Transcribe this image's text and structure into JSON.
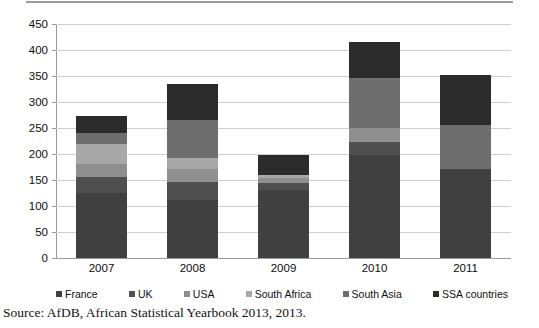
{
  "figure": {
    "source_note": "Source: AfDB, African Statistical Yearbook 2013, 2013."
  },
  "chart_data": {
    "type": "bar",
    "stacked": true,
    "title": "",
    "xlabel": "",
    "ylabel": "",
    "categories": [
      "2007",
      "2008",
      "2009",
      "2010",
      "2011"
    ],
    "ylim": [
      0,
      450
    ],
    "yticks": [
      0,
      50,
      100,
      150,
      200,
      250,
      300,
      350,
      400,
      450
    ],
    "ytick_labels": [
      "0",
      "50",
      "100",
      "150",
      "200",
      "250",
      "300",
      "350",
      "400",
      "450"
    ],
    "grid": true,
    "legend_position": "bottom",
    "series": [
      {
        "name": "France",
        "color": "#404040",
        "values": [
          125,
          112,
          130,
          198,
          172
        ]
      },
      {
        "name": "UK",
        "color": "#4f4f4f",
        "values": [
          30,
          35,
          15,
          25,
          0
        ]
      },
      {
        "name": "USA",
        "color": "#8f8f8f",
        "values": [
          25,
          25,
          8,
          27,
          0
        ]
      },
      {
        "name": "South Africa",
        "color": "#a8a8a8",
        "values": [
          40,
          21,
          7,
          0,
          0
        ]
      },
      {
        "name": "South Asia",
        "color": "#6e6e6e",
        "values": [
          20,
          72,
          0,
          97,
          83
        ]
      },
      {
        "name": "SSA countries",
        "color": "#2b2b2b",
        "values": [
          33,
          70,
          39,
          68,
          97
        ]
      }
    ],
    "totals": [
      273,
      335,
      199,
      415,
      352
    ]
  }
}
